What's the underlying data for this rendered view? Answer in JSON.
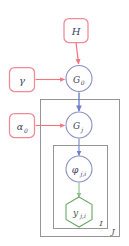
{
  "diagram": {
    "type": "plate-notation-graphical-model"
  },
  "colors": {
    "hyperparameter_stroke": "#f08a95",
    "hyperparameter_fill": "#ffffff",
    "hyperparameter_arrow": "#f4737f",
    "latent_stroke": "#8b8fc4",
    "latent_arrow": "#6f7fd0",
    "observed_stroke": "#6aa86a",
    "observed_arrow": "#7fb87f",
    "plate_stroke": "#808080",
    "text": "#3a3a55",
    "background": "#ffffff"
  },
  "nodes": {
    "h": {
      "label": "H",
      "sub": "",
      "shape": "rounded-rect",
      "role": "hyperparameter",
      "x": 76,
      "y": 30,
      "w": 25,
      "h": 24
    },
    "gamma": {
      "label": "γ",
      "sub": "",
      "shape": "rounded-rect",
      "role": "hyperparameter",
      "x": 22,
      "y": 79,
      "w": 26,
      "h": 24
    },
    "alpha0": {
      "label": "α",
      "sub": "0",
      "shape": "rounded-rect",
      "role": "hyperparameter",
      "x": 22,
      "y": 125,
      "w": 26,
      "h": 24
    },
    "g0": {
      "label": "G",
      "sub": "0",
      "shape": "circle",
      "role": "latent",
      "x": 79,
      "y": 79,
      "r": 13
    },
    "gj": {
      "label": "G",
      "sub": "j",
      "shape": "circle",
      "role": "latent",
      "x": 79,
      "y": 125,
      "r": 13
    },
    "phi": {
      "label": "φ",
      "sub": "j,i",
      "shape": "circle",
      "role": "latent",
      "x": 79,
      "y": 169,
      "r": 13
    },
    "y": {
      "label": "y",
      "sub": "j,i",
      "shape": "hexagon",
      "role": "observed",
      "x": 79,
      "y": 212,
      "r": 15
    }
  },
  "edges": [
    {
      "name": "h-to-g0",
      "from": "H",
      "to": "G0",
      "color_role": "hyperparameter"
    },
    {
      "name": "gamma-to-g0",
      "from": "gamma",
      "to": "G0",
      "color_role": "hyperparameter"
    },
    {
      "name": "alpha0-to-gj",
      "from": "alpha0",
      "to": "Gj",
      "color_role": "hyperparameter"
    },
    {
      "name": "g0-to-gj",
      "from": "G0",
      "to": "Gj",
      "color_role": "latent"
    },
    {
      "name": "gj-to-phi",
      "from": "Gj",
      "to": "phi",
      "color_role": "latent"
    },
    {
      "name": "phi-to-y",
      "from": "phi",
      "to": "y",
      "color_role": "observed"
    }
  ],
  "plates": {
    "outer": {
      "label": "J",
      "x": 40,
      "y": 99,
      "w": 80,
      "h": 138
    },
    "inner": {
      "label": "I",
      "x": 53,
      "y": 145,
      "w": 55,
      "h": 84
    }
  }
}
